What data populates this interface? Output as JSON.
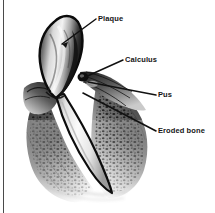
{
  "figure": {
    "border_color": "#4a4a4a",
    "background_color": "#ffffff",
    "ink_color": "#151515"
  },
  "labels": [
    {
      "id": "plaque",
      "text": "Plaque",
      "name": "label-plaque"
    },
    {
      "id": "calculus",
      "text": "Calculus",
      "name": "label-calculus"
    },
    {
      "id": "pus",
      "text": "Pus",
      "name": "label-pus"
    },
    {
      "id": "eroded",
      "text": "Eroded bone",
      "name": "label-eroded-bone"
    }
  ],
  "leader_lines": [
    {
      "id": "plaque",
      "from_x": 96,
      "from_y": 19,
      "to_x": 62,
      "to_y": 44
    },
    {
      "id": "calculus",
      "from_x": 123,
      "from_y": 60,
      "to_x": 83,
      "to_y": 78
    },
    {
      "id": "pus",
      "from_x": 156,
      "from_y": 95,
      "to_x": 88,
      "to_y": 82
    },
    {
      "id": "eroded",
      "from_x": 156,
      "from_y": 131,
      "to_x": 83,
      "to_y": 93
    }
  ],
  "anatomy": [
    {
      "id": "crown",
      "label": "tooth crown with plaque deposit"
    },
    {
      "id": "root",
      "label": "tooth root"
    },
    {
      "id": "gingiva-left",
      "label": "left gum tissue"
    },
    {
      "id": "gingiva-right",
      "label": "right gum tissue with calculus and pus"
    },
    {
      "id": "bone-left",
      "label": "eroded alveolar bone left"
    },
    {
      "id": "bone-right",
      "label": "eroded alveolar bone right"
    }
  ]
}
